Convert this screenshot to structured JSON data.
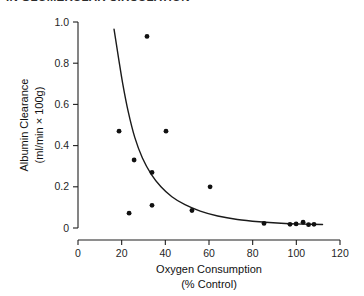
{
  "header": {
    "clipped_title": "IN GLOMERULAR CIRCULATION"
  },
  "figure": {
    "background_color": "#ffffff",
    "ink_color": "#111111"
  },
  "axes": {
    "x": {
      "title_line1": "Oxygen Consumption",
      "title_line2": "(% Control)",
      "ticks": [
        "0",
        "20",
        "40",
        "60",
        "80",
        "100",
        "120"
      ],
      "min": 0,
      "max": 120
    },
    "y": {
      "title_line1": "Albumin Clearance",
      "title_line2": "(ml/min × 100g)",
      "ticks": [
        "0",
        "0.2",
        "0.4",
        "0.6",
        "0.8",
        "1.0"
      ],
      "min": 0,
      "max": 1.0
    }
  },
  "chart_data": {
    "type": "scatter",
    "title": "",
    "xlabel": "Oxygen Consumption (% Control)",
    "ylabel": "Albumin Clearance (ml/min × 100g)",
    "xlim": [
      0,
      120
    ],
    "ylim": [
      0,
      1.0
    ],
    "xticks": [
      0,
      20,
      40,
      60,
      80,
      100,
      120
    ],
    "yticks": [
      0,
      0.2,
      0.4,
      0.6,
      0.8,
      1.0
    ],
    "grid": false,
    "legend": null,
    "marker": "filled-circle",
    "points": [
      {
        "x": 31.6,
        "y": 0.93
      },
      {
        "x": 18.8,
        "y": 0.47
      },
      {
        "x": 40.3,
        "y": 0.47
      },
      {
        "x": 25.7,
        "y": 0.33
      },
      {
        "x": 33.9,
        "y": 0.27
      },
      {
        "x": 60.5,
        "y": 0.2
      },
      {
        "x": 52.2,
        "y": 0.085
      },
      {
        "x": 33.9,
        "y": 0.11
      },
      {
        "x": 23.4,
        "y": 0.072
      },
      {
        "x": 85.2,
        "y": 0.022
      },
      {
        "x": 97.1,
        "y": 0.018
      },
      {
        "x": 99.9,
        "y": 0.02
      },
      {
        "x": 103.1,
        "y": 0.028
      },
      {
        "x": 105.6,
        "y": 0.016
      },
      {
        "x": 108.1,
        "y": 0.018
      }
    ],
    "fit_curve": {
      "label": "decay-fit",
      "points": [
        {
          "x": 16.5,
          "y": 0.965
        },
        {
          "x": 18.5,
          "y": 0.83
        },
        {
          "x": 20.5,
          "y": 0.7
        },
        {
          "x": 23.0,
          "y": 0.565
        },
        {
          "x": 26.0,
          "y": 0.44
        },
        {
          "x": 29.5,
          "y": 0.34
        },
        {
          "x": 33.5,
          "y": 0.262
        },
        {
          "x": 38.0,
          "y": 0.2
        },
        {
          "x": 43.0,
          "y": 0.152
        },
        {
          "x": 49.0,
          "y": 0.113
        },
        {
          "x": 56.0,
          "y": 0.082
        },
        {
          "x": 64.0,
          "y": 0.058
        },
        {
          "x": 73.0,
          "y": 0.041
        },
        {
          "x": 83.0,
          "y": 0.03
        },
        {
          "x": 93.0,
          "y": 0.023
        },
        {
          "x": 103.0,
          "y": 0.019
        },
        {
          "x": 112.0,
          "y": 0.017
        }
      ]
    }
  }
}
